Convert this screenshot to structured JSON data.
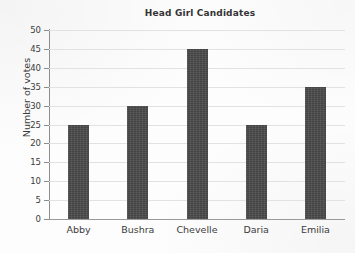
{
  "chart_data": {
    "type": "bar",
    "title": "Head Girl Candidates",
    "xlabel": "",
    "ylabel": "Number of votes",
    "categories": [
      "Abby",
      "Bushra",
      "Chevelle",
      "Daria",
      "Emilia"
    ],
    "values": [
      25,
      30,
      45,
      25,
      35
    ],
    "ylim": [
      0,
      50
    ],
    "ytick_step": 5,
    "yticks": [
      0,
      5,
      10,
      15,
      20,
      25,
      30,
      35,
      40,
      45,
      50
    ],
    "ytick_labels": [
      "0",
      "5",
      "10",
      "15",
      "20",
      "25",
      "30",
      "35",
      "40",
      "45",
      "50"
    ],
    "grid": true,
    "grid_axis": "y",
    "legend": false,
    "bar_color": "#4b4b4b",
    "gridline_color": "#e2e2e2",
    "axis_color": "#8d8d8d",
    "background_color": "#fdfdfd",
    "text_color": "#3b3b3b"
  }
}
